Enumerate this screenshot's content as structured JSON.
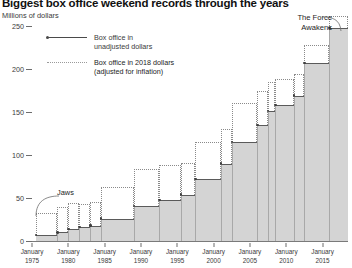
{
  "title": "Biggest box office weekend records through the years",
  "axis": {
    "ylabel": "Millions of dollars",
    "yticks": [
      0,
      50,
      100,
      150,
      200,
      250
    ],
    "ylim": [
      0,
      262
    ],
    "xticks": [
      {
        "month": "January",
        "year": "1975"
      },
      {
        "month": "January",
        "year": "1980"
      },
      {
        "month": "January",
        "year": "1985"
      },
      {
        "month": "January",
        "year": "1990"
      },
      {
        "month": "January",
        "year": "1995"
      },
      {
        "month": "January",
        "year": "2000"
      },
      {
        "month": "January",
        "year": "2005"
      },
      {
        "month": "January",
        "year": "2010"
      },
      {
        "month": "January",
        "year": "2015"
      }
    ]
  },
  "legend": [
    {
      "style": "solid",
      "line1": "Box office in",
      "line2": "unadjusted dollars"
    },
    {
      "style": "dotted",
      "line1": "Box office in 2018 dollars",
      "line2": "(adjusted for inflation)"
    }
  ],
  "annotations": [
    {
      "id": "jaws",
      "label": "Jaws"
    },
    {
      "id": "force",
      "line1": "The Force",
      "line2": "Awakens"
    }
  ],
  "colors": {
    "unadjusted_fill": "#d4d4d4",
    "unadjusted_line": "#5a5a5a",
    "adjusted_line": "#8a8a8a",
    "axis": "#6d6d6d",
    "text": "#231f20"
  },
  "chart_data": {
    "type": "bar",
    "title": "Biggest box office weekend records through the years",
    "xlabel": "",
    "ylabel": "Millions of dollars",
    "ylim": [
      0,
      262
    ],
    "xlim": [
      1975.0,
      2018.5
    ],
    "grid": false,
    "legend_position": "upper-left",
    "note": "Step/staircase chart: each record-setting opening weekend holds a plateau until the next record. Gray filled step = unadjusted dollars; dotted open box above = same record expressed in 2018 dollars.",
    "series": [
      {
        "name": "Box office in unadjusted dollars",
        "style": "solid-fill"
      },
      {
        "name": "Box office in 2018 dollars (adjusted for inflation)",
        "style": "dotted-outline"
      }
    ],
    "records": [
      {
        "start": 1975.5,
        "end": 1978.5,
        "unadjusted": 7,
        "adjusted": 33,
        "label": "Jaws"
      },
      {
        "start": 1978.5,
        "end": 1980.0,
        "unadjusted": 10,
        "adjusted": 39
      },
      {
        "start": 1980.0,
        "end": 1981.5,
        "unadjusted": 14,
        "adjusted": 44
      },
      {
        "start": 1981.5,
        "end": 1983.0,
        "unadjusted": 16,
        "adjusted": 43
      },
      {
        "start": 1983.0,
        "end": 1984.5,
        "unadjusted": 18,
        "adjusted": 45
      },
      {
        "start": 1984.5,
        "end": 1989.0,
        "unadjusted": 26,
        "adjusted": 63
      },
      {
        "start": 1989.0,
        "end": 1992.5,
        "unadjusted": 41,
        "adjusted": 84
      },
      {
        "start": 1992.5,
        "end": 1995.5,
        "unadjusted": 48,
        "adjusted": 88
      },
      {
        "start": 1995.5,
        "end": 1997.5,
        "unadjusted": 54,
        "adjusted": 91
      },
      {
        "start": 1997.5,
        "end": 2001.0,
        "unadjusted": 72,
        "adjusted": 115
      },
      {
        "start": 2001.0,
        "end": 2002.5,
        "unadjusted": 90,
        "adjusted": 130
      },
      {
        "start": 2002.5,
        "end": 2006.0,
        "unadjusted": 115,
        "adjusted": 161
      },
      {
        "start": 2006.0,
        "end": 2007.5,
        "unadjusted": 135,
        "adjusted": 174
      },
      {
        "start": 2007.5,
        "end": 2008.5,
        "unadjusted": 151,
        "adjusted": 185
      },
      {
        "start": 2008.5,
        "end": 2011.0,
        "unadjusted": 158,
        "adjusted": 188
      },
      {
        "start": 2011.0,
        "end": 2012.5,
        "unadjusted": 169,
        "adjusted": 194
      },
      {
        "start": 2012.5,
        "end": 2015.9,
        "unadjusted": 207,
        "adjusted": 228
      },
      {
        "start": 2015.9,
        "end": 2018.5,
        "unadjusted": 248,
        "adjusted": 262,
        "label": "The Force Awakens"
      }
    ]
  }
}
